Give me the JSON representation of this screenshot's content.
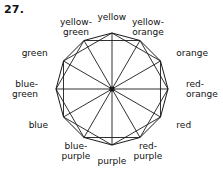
{
  "problem": {
    "number": "27."
  },
  "figure": {
    "type": "color-wheel-dodecagon",
    "sides": 12,
    "stroke_color": "#1a1a1a",
    "fill_color": "#ffffff",
    "center_marker": "filled-dot",
    "labels": [
      {
        "id": "yellow",
        "text": "yellow",
        "angle_deg": 90,
        "align": "center"
      },
      {
        "id": "yellow-orange",
        "text": "yellow-\norange",
        "angle_deg": 60,
        "align": "center"
      },
      {
        "id": "orange",
        "text": "orange",
        "angle_deg": 30,
        "align": "right"
      },
      {
        "id": "red-orange",
        "text": "red-\norange",
        "angle_deg": 0,
        "align": "right"
      },
      {
        "id": "red",
        "text": "red",
        "angle_deg": -30,
        "align": "right"
      },
      {
        "id": "red-purple",
        "text": "red-\npurple",
        "angle_deg": -60,
        "align": "center"
      },
      {
        "id": "purple",
        "text": "purple",
        "angle_deg": -90,
        "align": "center"
      },
      {
        "id": "blue-purple",
        "text": "blue-\npurple",
        "angle_deg": -120,
        "align": "center"
      },
      {
        "id": "blue",
        "text": "blue",
        "angle_deg": -150,
        "align": "left"
      },
      {
        "id": "blue-green",
        "text": "blue-\ngreen",
        "angle_deg": 180,
        "align": "left"
      },
      {
        "id": "green",
        "text": "green",
        "angle_deg": 150,
        "align": "left"
      },
      {
        "id": "yellow-green",
        "text": "yellow-\ngreen",
        "angle_deg": 120,
        "align": "center"
      }
    ]
  },
  "chart_data": {
    "type": "pie",
    "title": "",
    "categories": [
      "yellow",
      "yellow-orange",
      "orange",
      "red-orange",
      "red",
      "red-purple",
      "purple",
      "blue-purple",
      "blue",
      "blue-green",
      "green",
      "yellow-green"
    ],
    "values": [
      30,
      30,
      30,
      30,
      30,
      30,
      30,
      30,
      30,
      30,
      30,
      30
    ],
    "xlabel": "",
    "ylabel": "",
    "legend": "none",
    "grid": false
  }
}
